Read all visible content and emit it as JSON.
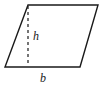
{
  "figure": {
    "kind": "parallelogram-with-height",
    "background_color": "#ffffff",
    "stroke_color": "#1a1a1a",
    "stroke_width": 1.4,
    "dash_stroke_color": "#1a1a1a",
    "dash_pattern": "3,3",
    "dash_width": 1.2,
    "outline": {
      "points": "28,5 98,5 80,67 5,67",
      "vertices": [
        {
          "name": "top-left",
          "x": 28,
          "y": 5
        },
        {
          "name": "top-right",
          "x": 98,
          "y": 5
        },
        {
          "name": "bottom-right",
          "x": 80,
          "y": 67
        },
        {
          "name": "bottom-left",
          "x": 5,
          "y": 67
        }
      ]
    },
    "height_segment": {
      "x1": 28,
      "y1": 6,
      "x2": 28,
      "y2": 66
    }
  },
  "labels": {
    "height": {
      "text": "h",
      "x": 33,
      "y": 40
    },
    "base": {
      "text": "b",
      "x": 40,
      "y": 82
    }
  }
}
